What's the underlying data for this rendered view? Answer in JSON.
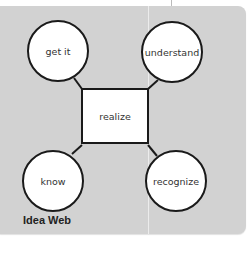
{
  "diagram": {
    "caption": "Idea Web",
    "center": {
      "label": "realize"
    },
    "nodes": [
      {
        "id": "top-left",
        "label": "get it"
      },
      {
        "id": "top-right",
        "label": "understand"
      },
      {
        "id": "bottom-left",
        "label": "know"
      },
      {
        "id": "bottom-right",
        "label": "recognize"
      }
    ],
    "colors": {
      "panel": "#d2d2d2",
      "node_fill": "#ffffff",
      "stroke": "#1a1a1a"
    }
  }
}
